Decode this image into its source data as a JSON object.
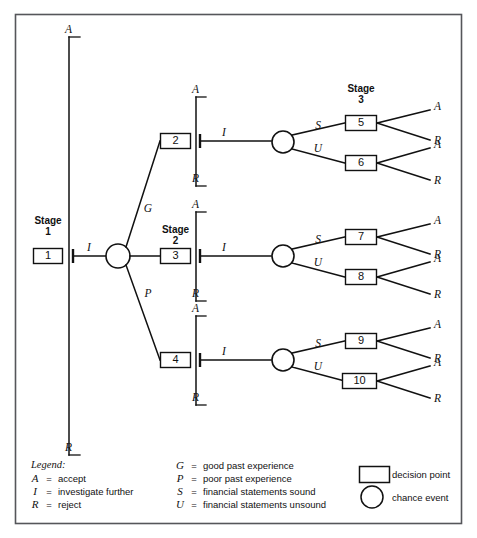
{
  "diagram": {
    "stage_labels": [
      {
        "id": "stage-1",
        "line1": "Stage",
        "line2": "1"
      },
      {
        "id": "stage-2",
        "line1": "Stage",
        "line2": "2"
      },
      {
        "id": "stage-3",
        "line1": "Stage",
        "line2": "3"
      }
    ],
    "decision_nodes": [
      {
        "id": "node-1",
        "label": "1"
      },
      {
        "id": "node-2",
        "label": "2"
      },
      {
        "id": "node-3",
        "label": "3"
      },
      {
        "id": "node-4",
        "label": "4"
      },
      {
        "id": "node-5",
        "label": "5"
      },
      {
        "id": "node-6",
        "label": "6"
      },
      {
        "id": "node-7",
        "label": "7"
      },
      {
        "id": "node-8",
        "label": "8"
      },
      {
        "id": "node-9",
        "label": "9"
      },
      {
        "id": "node-10",
        "label": "10"
      }
    ],
    "branch_labels": {
      "investigate": "I",
      "accept": "A",
      "reject": "R",
      "good_experience": "G",
      "poor_experience": "P",
      "sound": "S",
      "unsound": "U"
    },
    "stage1_branches": [
      {
        "label": "A",
        "position": "top"
      },
      {
        "label": "I",
        "position": "middle"
      },
      {
        "label": "R",
        "position": "bottom"
      }
    ],
    "chance_branches": [
      {
        "label": "G",
        "target": "2"
      },
      {
        "label": "I",
        "target": "3"
      },
      {
        "label": "P",
        "target": "4"
      }
    ],
    "stage2_nodes": [
      {
        "node": "2",
        "up": "A",
        "right": "I",
        "down": "R"
      },
      {
        "node": "3",
        "up": "A",
        "right": "I",
        "down": "R"
      },
      {
        "node": "4",
        "up": "A",
        "right": "I",
        "down": "R"
      }
    ],
    "stage3_groups": [
      {
        "sound_label": "S",
        "unsound_label": "U",
        "sound_node": "5",
        "unsound_node": "6",
        "sound_outcomes": [
          "A",
          "R"
        ],
        "unsound_outcomes": [
          "A",
          "R"
        ]
      },
      {
        "sound_label": "S",
        "unsound_label": "U",
        "sound_node": "7",
        "unsound_node": "8",
        "sound_outcomes": [
          "A",
          "R"
        ],
        "unsound_outcomes": [
          "A",
          "R"
        ]
      },
      {
        "sound_label": "S",
        "unsound_label": "U",
        "sound_node": "9",
        "unsound_node": "10",
        "sound_outcomes": [
          "A",
          "R"
        ],
        "unsound_outcomes": [
          "A",
          "R"
        ]
      }
    ]
  },
  "legend": {
    "title": "Legend:",
    "equals": "=",
    "column1": [
      {
        "key": "A",
        "definition": "accept"
      },
      {
        "key": "I",
        "definition": "investigate further"
      },
      {
        "key": "R",
        "definition": "reject"
      }
    ],
    "column2": [
      {
        "key": "G",
        "definition": "good past experience"
      },
      {
        "key": "P",
        "definition": "poor past experience"
      },
      {
        "key": "S",
        "definition": "financial statements sound"
      },
      {
        "key": "U",
        "definition": "financial statements unsound"
      }
    ],
    "symbols": [
      {
        "shape": "rectangle",
        "label": "decision point"
      },
      {
        "shape": "circle",
        "label": "chance event"
      }
    ]
  },
  "colors": {
    "line": "#111111",
    "frame": "#55565a",
    "background": "#ffffff"
  }
}
